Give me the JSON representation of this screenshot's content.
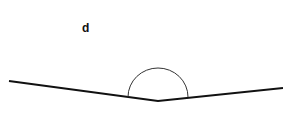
{
  "diagram": {
    "label": "d",
    "line_color": "#111111",
    "arc_color": "#333333"
  }
}
